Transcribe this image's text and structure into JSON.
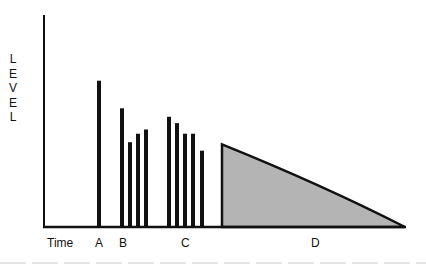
{
  "chart_data": {
    "type": "bar",
    "title": "",
    "xlabel": "Time",
    "ylabel": "LEVEL",
    "ylim": [
      0,
      100
    ],
    "grid": false,
    "legend": null,
    "categories": [
      "A",
      "B",
      "C",
      "D"
    ],
    "groups": [
      {
        "label": "A",
        "bars": [
          {
            "x": 99,
            "level": 69
          }
        ]
      },
      {
        "label": "B",
        "bars": [
          {
            "x": 122,
            "level": 56
          },
          {
            "x": 130,
            "level": 40
          },
          {
            "x": 138,
            "level": 44
          },
          {
            "x": 146,
            "level": 46
          }
        ]
      },
      {
        "label": "C",
        "bars": [
          {
            "x": 169,
            "level": 52
          },
          {
            "x": 177,
            "level": 49
          },
          {
            "x": 185,
            "level": 44
          },
          {
            "x": 193,
            "level": 44
          },
          {
            "x": 202,
            "level": 36
          }
        ]
      },
      {
        "label": "D",
        "shape": "decay-area",
        "start_x": 222,
        "end_x": 405,
        "start_level": 39,
        "end_level": 0,
        "fill": "#b4b4b4"
      }
    ],
    "label_positions": {
      "Time": 47,
      "A": 95,
      "B": 119,
      "C": 181,
      "D": 311
    }
  },
  "axis": {
    "ylabel_letters": [
      "L",
      "E",
      "V",
      "E",
      "L"
    ]
  },
  "colors": {
    "bar": "#111111",
    "area_fill": "#b4b4b4",
    "axis": "#111111"
  }
}
